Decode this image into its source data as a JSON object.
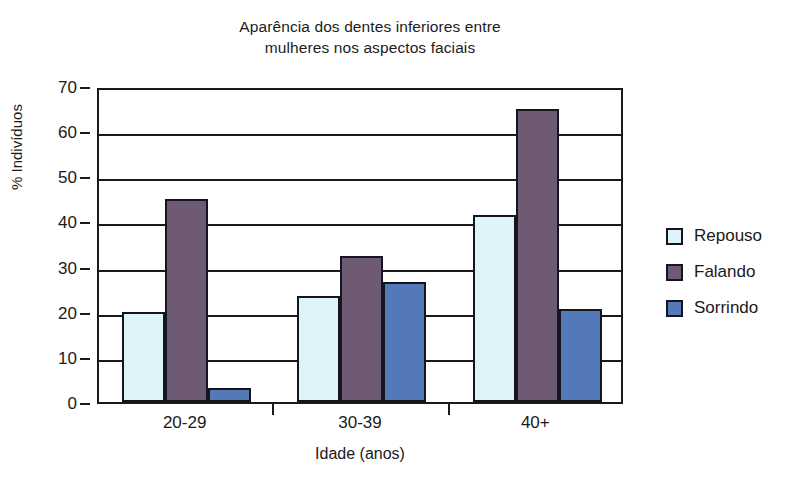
{
  "chart_data": {
    "type": "bar",
    "title": "Aparência dos dentes inferiores entre mulheres nos aspectos faciais",
    "title_line1": "Aparência dos dentes inferiores entre",
    "title_line2": "mulheres nos aspectos faciais",
    "xlabel": "Idade (anos)",
    "ylabel": "% Indivíduos",
    "categories": [
      "20-29",
      "30-39",
      "40+"
    ],
    "series": [
      {
        "name": "Repouso",
        "color": "#dff4fa",
        "values": [
          20,
          23.5,
          41.5
        ]
      },
      {
        "name": "Falando",
        "color": "#6e5a73",
        "values": [
          45,
          32.3,
          65
        ]
      },
      {
        "name": "Sorrindo",
        "color": "#5479b8",
        "values": [
          3,
          26.5,
          20.5
        ]
      }
    ],
    "ylim": [
      0,
      70
    ],
    "ytick_values": [
      0,
      10,
      20,
      30,
      40,
      50,
      60,
      70
    ],
    "ytick_labels": [
      "0",
      "10",
      "20",
      "30",
      "40",
      "50",
      "60",
      "70"
    ],
    "grid": true,
    "legend_position": "right",
    "bar_edge_color": "#15151f",
    "axis_color": "#1a1a1a"
  }
}
